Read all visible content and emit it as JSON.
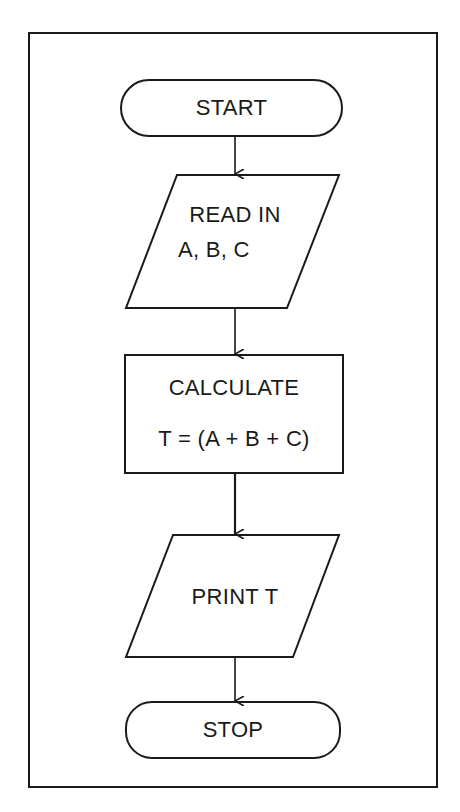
{
  "diagram": {
    "type": "flowchart",
    "nodes": [
      {
        "id": "start",
        "shape": "terminal",
        "text": "START"
      },
      {
        "id": "read",
        "shape": "parallelogram",
        "line1": "READ IN",
        "line2": "A, B, C"
      },
      {
        "id": "calc",
        "shape": "process",
        "line1": "CALCULATE",
        "line2": "T = (A + B + C)"
      },
      {
        "id": "print",
        "shape": "parallelogram",
        "text": "PRINT T"
      },
      {
        "id": "stop",
        "shape": "terminal",
        "text": "STOP"
      }
    ],
    "edges": [
      {
        "from": "start",
        "to": "read"
      },
      {
        "from": "read",
        "to": "calc"
      },
      {
        "from": "calc",
        "to": "print"
      },
      {
        "from": "print",
        "to": "stop"
      }
    ],
    "colors": {
      "stroke": "#1a1a1a",
      "background": "#ffffff"
    }
  }
}
